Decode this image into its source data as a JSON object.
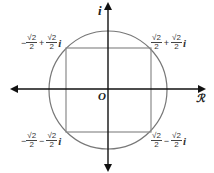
{
  "diagram": {
    "title": "",
    "axes": {
      "real_label": "ℛ",
      "imag_label": "i",
      "origin_label": "O"
    },
    "colors": {
      "axis": "#111111",
      "circle": "#777777",
      "square": "#8a8a8a",
      "text": "#333333"
    },
    "points": [
      {
        "id": "q1",
        "sign1": "",
        "num1": "√2",
        "den1": "2",
        "op": "+",
        "num2": "√2",
        "den2": "2",
        "unit": "i"
      },
      {
        "id": "q2",
        "sign1": "−",
        "num1": "√2",
        "den1": "2",
        "op": "+",
        "num2": "√2",
        "den2": "2",
        "unit": "i"
      },
      {
        "id": "q3",
        "sign1": "−",
        "num1": "√2",
        "den1": "2",
        "op": "−",
        "num2": "√2",
        "den2": "2",
        "unit": "i"
      },
      {
        "id": "q4",
        "sign1": "",
        "num1": "√2",
        "den1": "2",
        "op": "−",
        "num2": "√2",
        "den2": "2",
        "unit": "i"
      }
    ]
  }
}
